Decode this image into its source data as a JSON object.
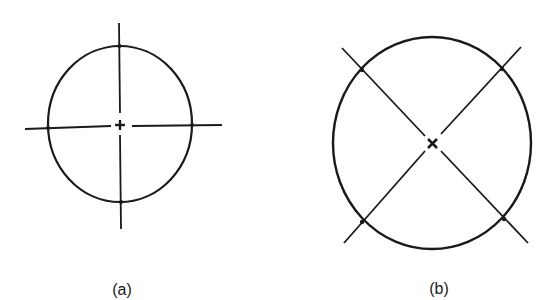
{
  "figure": {
    "panels": [
      {
        "id": "a",
        "label": "(a)",
        "description": "Circle with horizontal and vertical center lines extending beyond the circumference; center marked with small cross",
        "center": [
          120,
          124
        ],
        "radius": [
          73,
          78
        ],
        "orientation": "orthogonal"
      },
      {
        "id": "b",
        "label": "(b)",
        "description": "Circle with diagonal center lines at 45 degrees extending beyond the circumference; center marked with small x",
        "center": [
          433,
          143
        ],
        "radius": [
          99,
          106
        ],
        "orientation": "diagonal"
      }
    ],
    "stroke_color": "#1a1a1a",
    "background": "#ffffff"
  }
}
